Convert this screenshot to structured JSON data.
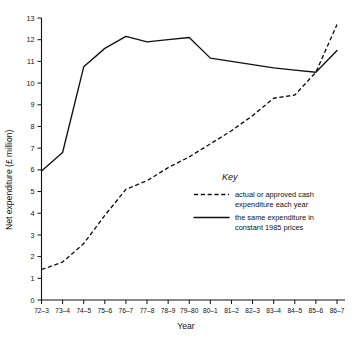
{
  "chart_data": {
    "type": "line",
    "title": "",
    "xlabel": "Year",
    "ylabel": "Net expenditure (£ million)",
    "categories": [
      "72–3",
      "73–4",
      "74–5",
      "75–6",
      "76–7",
      "77–8",
      "78–9",
      "79–80",
      "80–1",
      "81–2",
      "82–3",
      "83–4",
      "84–5",
      "85–6",
      "86–7"
    ],
    "ylim": [
      0,
      13
    ],
    "yticks": [
      0,
      1,
      2,
      3,
      4,
      5,
      6,
      7,
      8,
      9,
      10,
      11,
      12,
      13
    ],
    "grid": false,
    "legend_position": "inside-lower-right",
    "series": [
      {
        "name": "actual or approved cash expenditure each year",
        "style": "dashed",
        "color": "#111111",
        "values": [
          1.4,
          1.75,
          2.6,
          3.9,
          5.1,
          5.5,
          6.1,
          6.6,
          7.2,
          7.8,
          8.5,
          9.3,
          9.45,
          10.5,
          12.7
        ]
      },
      {
        "name": "the same expenditure in constant 1985 prices",
        "style": "solid",
        "color": "#111111",
        "values": [
          5.95,
          6.8,
          10.75,
          11.6,
          12.15,
          11.9,
          12.0,
          12.1,
          11.15,
          11.0,
          10.85,
          10.7,
          10.6,
          10.5,
          11.5
        ]
      }
    ]
  },
  "legend": {
    "title": "Key",
    "entries": [
      {
        "style": "dashed",
        "line1": "actual or approved cash",
        "line2": "expenditure each year"
      },
      {
        "style": "solid",
        "line1": "the same expenditure in",
        "line2": "constant 1985 prices"
      }
    ]
  }
}
